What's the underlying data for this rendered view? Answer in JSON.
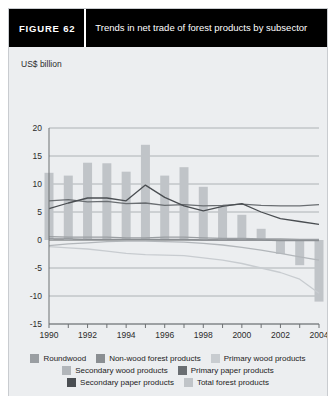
{
  "figure": {
    "tag": "FIGURE  62",
    "title": "Trends in net trade of forest products by subsector"
  },
  "colors": {
    "card_bg": "#eceef0",
    "header_bg": "#000000",
    "header_text": "#ffffff",
    "border": "#c9ccd0",
    "axis": "#6d7073",
    "gridline": "#9ea2a6",
    "roundwood": "#9a9ea2",
    "non_wood_forest_products": "#8a8e92",
    "primary_wood_products": "#c8ccd0",
    "secondary_wood_products": "#b2b6ba",
    "primary_paper_products": "#6a6e72",
    "secondary_paper_products": "#4a4e52",
    "total_forest_products": "#c0c4c8"
  },
  "chart_data": {
    "type": "bar",
    "title": "Trends in net trade of forest products by subsector",
    "xlabel": "",
    "ylabel": "US$ billion",
    "ylim": [
      -15,
      20
    ],
    "yticks": [
      -15,
      -10,
      -5,
      0,
      5,
      10,
      15,
      20
    ],
    "ytick_labels": [
      "-15",
      "-10",
      "-5",
      "0",
      "5",
      "10",
      "15",
      "20"
    ],
    "grid": true,
    "legend_position": "bottom",
    "x": [
      1990,
      1991,
      1992,
      1993,
      1994,
      1995,
      1996,
      1997,
      1998,
      1999,
      2000,
      2001,
      2002,
      2003,
      2004
    ],
    "xtick_labels": [
      "1990",
      "",
      "1992",
      "",
      "1994",
      "",
      "1996",
      "",
      "1998",
      "",
      "2000",
      "",
      "2002",
      "",
      "2004"
    ],
    "xticks_all": [
      1990,
      1991,
      1992,
      1993,
      1994,
      1995,
      1996,
      1997,
      1998,
      1999,
      2000,
      2001,
      2002,
      2003,
      2004
    ],
    "bar_series": {
      "name": "Total forest products",
      "color_key": "total_forest_products",
      "values": [
        12.0,
        11.5,
        13.8,
        13.7,
        12.2,
        17.0,
        11.5,
        13.0,
        9.5,
        6.0,
        4.5,
        2.0,
        -2.5,
        -4.5,
        -11.0
      ]
    },
    "series": [
      {
        "name": "Roundwood",
        "color_key": "roundwood",
        "type": "line",
        "values": [
          0.6,
          0.5,
          0.5,
          0.5,
          0.4,
          0.4,
          0.5,
          0.5,
          0.4,
          0.3,
          0.3,
          0.2,
          0.2,
          0.1,
          0.1
        ]
      },
      {
        "name": "Non-wood forest products",
        "color_key": "non_wood_forest_products",
        "type": "line",
        "values": [
          0.2,
          0.2,
          0.1,
          0.1,
          0.1,
          0.1,
          0.1,
          0.1,
          0.0,
          0.0,
          0.0,
          0.0,
          -0.1,
          -0.1,
          -0.1
        ]
      },
      {
        "name": "Primary wood products",
        "color_key": "primary_wood_products",
        "type": "line",
        "values": [
          -1.2,
          -1.4,
          -1.6,
          -2.0,
          -2.4,
          -2.6,
          -2.7,
          -2.8,
          -3.2,
          -3.6,
          -4.2,
          -5.0,
          -5.8,
          -7.0,
          -9.5
        ]
      },
      {
        "name": "Secondary wood products",
        "color_key": "secondary_wood_products",
        "type": "line",
        "values": [
          -1.0,
          -0.7,
          -0.5,
          -0.3,
          -0.2,
          -0.2,
          -0.3,
          -0.4,
          -0.6,
          -0.9,
          -1.3,
          -1.8,
          -2.4,
          -3.0,
          -3.6
        ]
      },
      {
        "name": "Primary paper products",
        "color_key": "primary_paper_products",
        "type": "line",
        "values": [
          7.0,
          7.2,
          6.8,
          6.9,
          6.5,
          6.6,
          6.2,
          6.3,
          6.1,
          6.2,
          6.4,
          6.2,
          6.1,
          6.1,
          6.3
        ]
      },
      {
        "name": "Secondary paper products",
        "color_key": "secondary_paper_products",
        "type": "line",
        "values": [
          5.6,
          6.6,
          7.5,
          7.5,
          7.0,
          9.8,
          7.6,
          6.1,
          5.2,
          6.0,
          6.5,
          5.0,
          3.8,
          3.3,
          2.8
        ]
      }
    ]
  },
  "legend": {
    "rows": [
      [
        {
          "label": "Roundwood",
          "color_key": "roundwood"
        },
        {
          "label": "Non-wood forest products",
          "color_key": "non_wood_forest_products"
        },
        {
          "label": "Primary wood products",
          "color_key": "primary_wood_products"
        }
      ],
      [
        {
          "label": "Secondary wood products",
          "color_key": "secondary_wood_products"
        },
        {
          "label": "Primary paper products",
          "color_key": "primary_paper_products"
        }
      ],
      [
        {
          "label": "Secondary paper products",
          "color_key": "secondary_paper_products"
        },
        {
          "label": "Total forest products",
          "color_key": "total_forest_products"
        }
      ]
    ]
  }
}
